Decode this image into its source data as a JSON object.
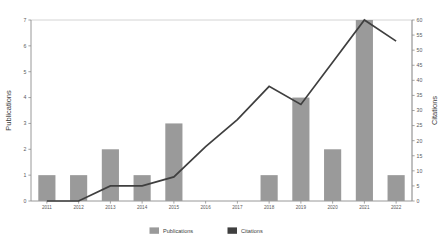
{
  "chart_data": {
    "type": "bar",
    "title": "",
    "subtitle": "",
    "xlabel": "",
    "ylabel": "Publications",
    "y2label": "Citations",
    "categories": [
      "2011",
      "2012",
      "2013",
      "2014",
      "2015",
      "2016",
      "2017",
      "2018",
      "2019",
      "2020",
      "2021",
      "2022"
    ],
    "series": [
      {
        "name": "Publications",
        "type": "bar",
        "axis": "left",
        "color": "#9a9a9a",
        "values": [
          1,
          1,
          2,
          1,
          3,
          0,
          0,
          1,
          4,
          2,
          7,
          1
        ]
      },
      {
        "name": "Citations",
        "type": "line",
        "axis": "right",
        "color": "#3f3f3f",
        "values": [
          0,
          0,
          5,
          5,
          8,
          18,
          27,
          38,
          32,
          46,
          60,
          53
        ]
      }
    ],
    "ylim": [
      0,
      7
    ],
    "yticks": [
      0,
      1,
      2,
      3,
      4,
      5,
      6,
      7
    ],
    "ytick_labels": [
      "0",
      "1",
      "2",
      "3",
      "4",
      "5",
      "6",
      "7"
    ],
    "y2lim": [
      0,
      60
    ],
    "y2ticks": [
      0,
      5,
      10,
      15,
      20,
      25,
      30,
      35,
      40,
      45,
      50,
      55,
      60
    ],
    "y2tick_labels": [
      "0",
      "5",
      "10",
      "15",
      "20",
      "25",
      "30",
      "35",
      "40",
      "45",
      "50",
      "55",
      "60"
    ],
    "grid": false,
    "legend": {
      "position": "bottom",
      "entries": [
        {
          "label": "Publications",
          "color": "#9a9a9a",
          "marker": "square"
        },
        {
          "label": "Citations",
          "color": "#3f3f3f",
          "marker": "square"
        }
      ]
    },
    "annotations": []
  }
}
